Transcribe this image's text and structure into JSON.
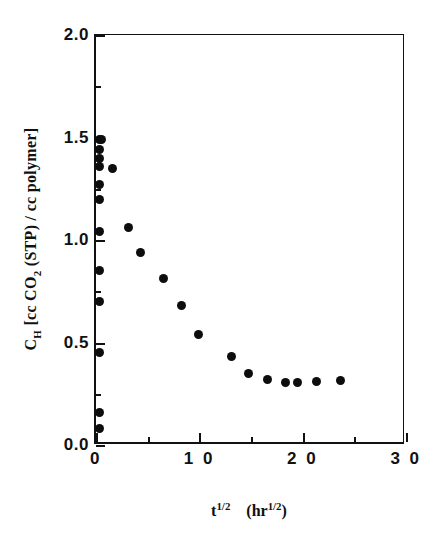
{
  "chart_data": {
    "type": "scatter",
    "title": "",
    "xlabel": "t^1/2  (hr^1/2)",
    "ylabel": "C_H [cc CO2 (STP) / cc polymer]",
    "xlim": [
      0,
      30
    ],
    "ylim": [
      0.0,
      2.0
    ],
    "x_ticks": [
      0,
      10,
      20,
      30
    ],
    "x_tick_labels": [
      "0",
      "1 0",
      "2 0",
      "3 0"
    ],
    "x_minor_ticks": [
      5,
      15,
      25
    ],
    "y_ticks": [
      0.0,
      0.5,
      1.0,
      1.5,
      2.0
    ],
    "y_tick_labels": [
      "0.0",
      "0.5",
      "1.0",
      "1.5",
      "2.0"
    ],
    "y_minor_ticks": [
      0.25,
      0.75,
      1.25,
      1.75
    ],
    "grid": false,
    "legend": null,
    "marker": "filled-circle",
    "marker_color": "#0d0d0d",
    "series": [
      {
        "name": "C_H vs t^1/2",
        "points": [
          [
            0.3,
            1.49
          ],
          [
            0.55,
            1.49
          ],
          [
            0.3,
            1.44
          ],
          [
            0.3,
            1.4
          ],
          [
            0.35,
            1.36
          ],
          [
            1.55,
            1.35
          ],
          [
            0.3,
            1.27
          ],
          [
            0.3,
            1.2
          ],
          [
            0.3,
            1.04
          ],
          [
            3.1,
            1.06
          ],
          [
            4.3,
            0.94
          ],
          [
            0.3,
            0.85
          ],
          [
            6.55,
            0.81
          ],
          [
            0.3,
            0.7
          ],
          [
            8.3,
            0.68
          ],
          [
            9.9,
            0.54
          ],
          [
            0.3,
            0.45
          ],
          [
            13.1,
            0.43
          ],
          [
            14.8,
            0.35
          ],
          [
            16.6,
            0.32
          ],
          [
            18.3,
            0.305
          ],
          [
            19.5,
            0.305
          ],
          [
            21.3,
            0.31
          ],
          [
            23.7,
            0.315
          ],
          [
            0.3,
            0.16
          ],
          [
            0.3,
            0.08
          ]
        ]
      }
    ]
  },
  "axis": {
    "x_title_main": "t",
    "x_title_main_sup": "1/2",
    "x_title_unit_open": "(hr",
    "x_title_unit_sup": "1/2",
    "x_title_unit_close": ")",
    "y_title_symbol": "C",
    "y_title_symbol_sub": "H",
    "y_title_rest_a": " [cc CO",
    "y_title_rest_sub": "2",
    "y_title_rest_b": " (STP) / cc polymer]"
  },
  "colors": {
    "axis": "#111111",
    "marker": "#0d0d0d",
    "background": "#ffffff"
  }
}
